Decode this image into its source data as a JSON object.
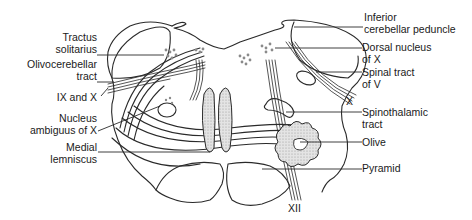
{
  "figure": {
    "colors": {
      "line": "#2a2a2a",
      "stipple": "#d6d6d6",
      "background": "#ffffff"
    }
  },
  "labels": {
    "left": [
      {
        "id": "tractus-solitarius",
        "lines": [
          "Tractus",
          "solitarius"
        ]
      },
      {
        "id": "olivocerebellar-tract",
        "lines": [
          "Olivocerebellar",
          "tract"
        ]
      },
      {
        "id": "ix-and-x",
        "lines": [
          "IX and X"
        ]
      },
      {
        "id": "nucleus-ambiguus",
        "lines": [
          "Nucleus",
          "ambiguus of X"
        ]
      },
      {
        "id": "medial-lemniscus",
        "lines": [
          "Medial",
          "lemniscus"
        ]
      }
    ],
    "right": [
      {
        "id": "inferior-cerebellar-peduncle",
        "lines": [
          "Inferior",
          "cerebellar peduncle"
        ]
      },
      {
        "id": "dorsal-nucleus-x",
        "lines": [
          "Dorsal nucleus",
          "of X"
        ]
      },
      {
        "id": "spinal-tract-v",
        "lines": [
          "Spinal tract",
          "of V"
        ]
      },
      {
        "id": "x-nerve",
        "lines": [
          "X"
        ]
      },
      {
        "id": "spinothalamic-tract",
        "lines": [
          "Spinothalamic",
          "tract"
        ]
      },
      {
        "id": "olive",
        "lines": [
          "Olive"
        ]
      },
      {
        "id": "pyramid",
        "lines": [
          "Pyramid"
        ]
      }
    ],
    "bottom": [
      {
        "id": "xii-nerve",
        "lines": [
          "XII"
        ]
      }
    ]
  }
}
